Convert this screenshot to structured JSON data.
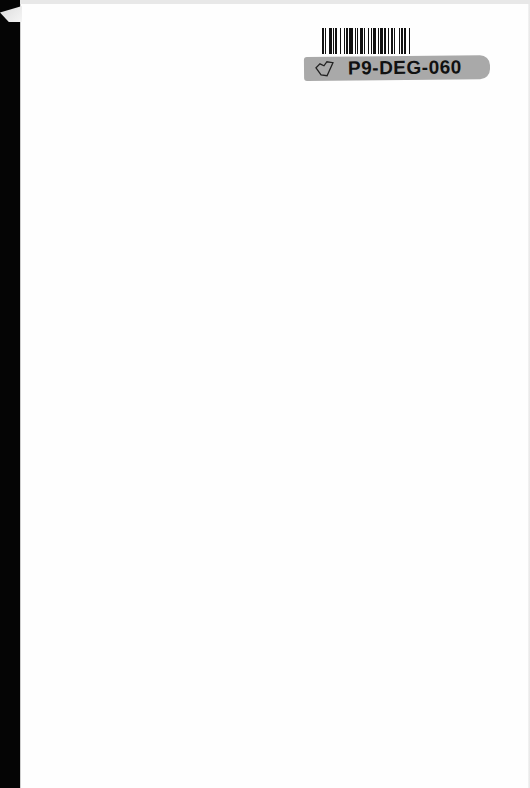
{
  "document": {
    "type": "scanned blank book page",
    "content": ""
  },
  "library_label": {
    "barcode_icon": "barcode",
    "catalog_icon": "map-outline-icon",
    "id_text": "P9-DEG-060",
    "strip_color": "#a9a9a9"
  },
  "colors": {
    "page": "#fefefe",
    "spine": "#050505"
  }
}
